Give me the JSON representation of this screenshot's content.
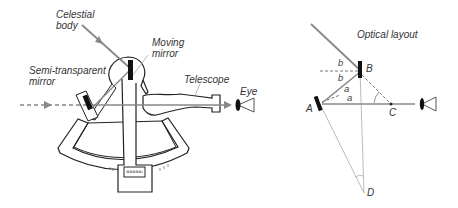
{
  "sextant": {
    "labels": {
      "celestial_line1": "Celestial",
      "celestial_line2": "body",
      "moving_line1": "Moving",
      "moving_line2": "mirror",
      "semi_line1": "Semi-transparent",
      "semi_line2": "mirror",
      "telescope": "Telescope",
      "eye": "Eye"
    }
  },
  "optical": {
    "title": "Optical layout",
    "points": {
      "A": "A",
      "B": "B",
      "C": "C",
      "D": "D"
    },
    "angles": {
      "b1": "b",
      "b2": "b",
      "a1": "a",
      "a2": "a"
    }
  },
  "colors": {
    "ray": "#888888",
    "outline": "#222222",
    "mirror": "#111111",
    "thin": "#aaaaaa"
  }
}
